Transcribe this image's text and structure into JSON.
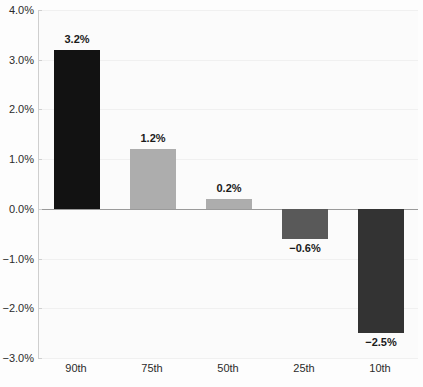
{
  "chart_data": {
    "type": "bar",
    "title": "",
    "subtitle": "",
    "xlabel": "",
    "ylabel": "",
    "categories": [
      "90th",
      "75th",
      "50th",
      "25th",
      "10th"
    ],
    "values": [
      3.2,
      1.2,
      0.2,
      -0.6,
      -2.5
    ],
    "value_labels": [
      "3.2%",
      "1.2%",
      "0.2%",
      "−0.6%",
      "−2.5%"
    ],
    "bar_colors": [
      "#121212",
      "#adadad",
      "#adadad",
      "#595959",
      "#333333"
    ],
    "ylim": [
      -3.0,
      4.0
    ],
    "ytick_values": [
      4.0,
      3.0,
      2.0,
      1.0,
      0.0,
      -1.0,
      -2.0,
      -3.0
    ],
    "ytick_labels": [
      "4.0%",
      "3.0%",
      "2.0%",
      "1.0%",
      "0.0%",
      "−1.0%",
      "−2.0%",
      "−3.0%"
    ],
    "grid": true,
    "grid_color": "#f0f0f0",
    "zero_line_color": "#9a9a9a",
    "axis_color": "#cfcfcf",
    "background_color": "#fbfbfb",
    "legend": null,
    "legend_position": "none"
  }
}
